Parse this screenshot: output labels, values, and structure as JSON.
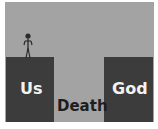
{
  "diagram": {
    "left_block": {
      "label": "Us"
    },
    "right_block": {
      "label": "God"
    },
    "gap": {
      "label": "Death"
    },
    "figure": {
      "icon": "stick-figure-icon"
    },
    "colors": {
      "background": "#a3a3a3",
      "blocks": "#3c3c3c",
      "block_text": "#f2f2f2",
      "gap_text": "#1e1e1e"
    }
  }
}
